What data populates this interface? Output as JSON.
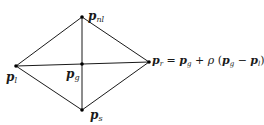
{
  "diagram": {
    "type": "simplex-reflection",
    "points": {
      "p_nl": {
        "label_main": "p",
        "label_sub": "nl",
        "x": 82,
        "y": 17
      },
      "p_l": {
        "label_main": "p",
        "label_sub": "l",
        "x": 16,
        "y": 66
      },
      "p_g": {
        "label_main": "p",
        "label_sub": "g",
        "x": 82,
        "y": 64
      },
      "p_r": {
        "label_main": "p",
        "label_sub": "r",
        "x": 149,
        "y": 62
      },
      "p_s": {
        "label_main": "p",
        "label_sub": "s",
        "x": 82,
        "y": 110
      }
    },
    "equation": {
      "lhs_main": "p",
      "lhs_sub": "r",
      "eq": " = ",
      "t1_main": "p",
      "t1_sub": "g",
      "plus": " + ",
      "rho": "ρ",
      "lparen": " (",
      "t2_main": "p",
      "t2_sub": "g",
      "minus": " − ",
      "t3_main": "p",
      "t3_sub": "l",
      "rparen": ")"
    },
    "line_color": "#1a1a1a"
  }
}
